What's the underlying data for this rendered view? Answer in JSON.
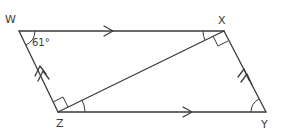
{
  "diagram": {
    "type": "geometry-parallelogram",
    "vertices": {
      "W": {
        "label": "W",
        "x": 19,
        "y": 31
      },
      "X": {
        "label": "X",
        "x": 224,
        "y": 31
      },
      "Y": {
        "label": "Y",
        "x": 266,
        "y": 112
      },
      "Z": {
        "label": "Z",
        "x": 58,
        "y": 112
      }
    },
    "edges": [
      {
        "from": "W",
        "to": "X",
        "marker": "single-arrow"
      },
      {
        "from": "Z",
        "to": "Y",
        "marker": "single-arrow"
      },
      {
        "from": "Z",
        "to": "W",
        "marker": "double-arrow"
      },
      {
        "from": "Y",
        "to": "X",
        "marker": "double-arrow"
      },
      {
        "from": "Z",
        "to": "X",
        "marker": "none"
      }
    ],
    "angles": {
      "W": {
        "label": "61°",
        "type": "arc"
      },
      "X_between_WX_and_XZ": {
        "type": "arc"
      },
      "X_between_XZ_and_XY": {
        "type": "right-angle"
      },
      "Z_between_ZW_and_ZX": {
        "type": "right-angle"
      },
      "Z_between_ZX_and_ZY": {
        "type": "arc"
      },
      "Y": {
        "type": "arc"
      }
    },
    "colors": {
      "stroke": "#3a3a3a",
      "background": "#ffffff"
    }
  }
}
